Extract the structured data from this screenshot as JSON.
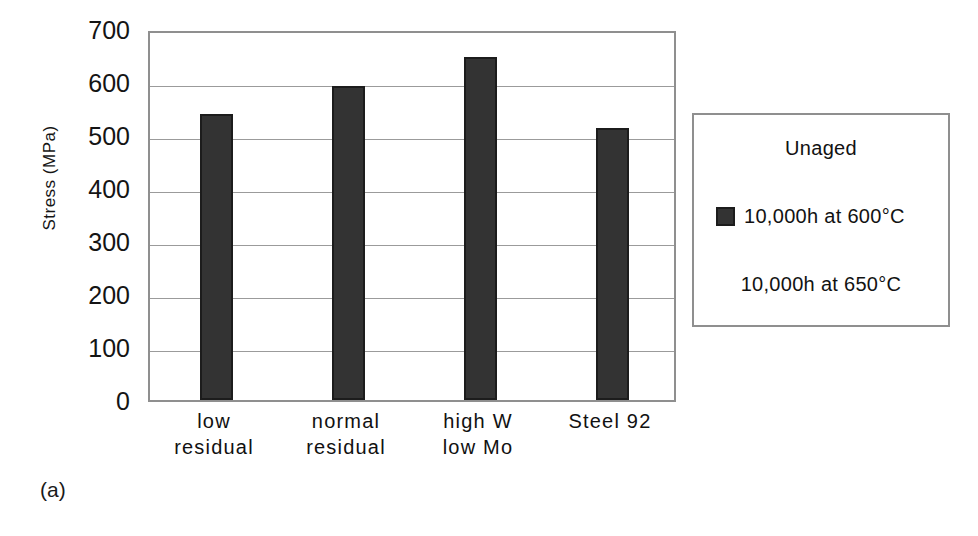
{
  "chart_data": {
    "type": "bar",
    "title": "",
    "subtitle": "",
    "xlabel": "",
    "ylabel": "Stress (MPa)",
    "categories": [
      "low residual",
      "normal residual",
      "high W low Mo",
      "Steel 92"
    ],
    "category_lines": [
      [
        "low",
        "residual"
      ],
      [
        "normal",
        "residual"
      ],
      [
        "high W",
        "low Mo"
      ],
      [
        "Steel 92",
        ""
      ]
    ],
    "series": [
      {
        "name": "10,000h at 600°C",
        "values": [
          540,
          592,
          647,
          513
        ],
        "color": "#333333"
      }
    ],
    "values": [
      540,
      592,
      647,
      513
    ],
    "ylim": [
      0,
      700
    ],
    "ytick_values": [
      700,
      600,
      500,
      400,
      300,
      200,
      100,
      0
    ],
    "ytick_labels": [
      "700",
      "600",
      "500",
      "400",
      "300",
      "200",
      "100",
      "0"
    ],
    "grid": true,
    "grid_axis": "y",
    "legend_position": "right-outside",
    "legend_entries": [
      {
        "label": "Unaged",
        "swatch": false
      },
      {
        "label": "10,000h at 600°C",
        "swatch": true
      },
      {
        "label": "10,000h at 650°C",
        "swatch": false
      }
    ],
    "panel_label": "(a)",
    "bar_color": "#333333",
    "bar_border_color": "#1c1c1c",
    "grid_color": "#9b9b9b",
    "axis_color": "#8f8f8f",
    "text_color": "#141414"
  }
}
